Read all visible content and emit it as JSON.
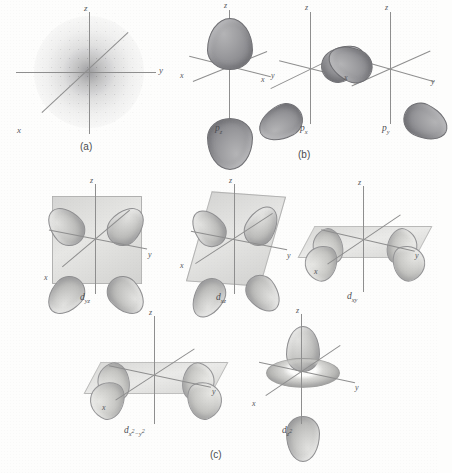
{
  "figure": {
    "panels": [
      {
        "id": "a",
        "label": "(a)",
        "caption": "s orbital electron density cloud"
      },
      {
        "id": "b",
        "label": "(b)",
        "caption": "p orbitals"
      },
      {
        "id": "c",
        "label": "(c)",
        "caption": "d orbitals"
      }
    ]
  },
  "axes": {
    "x": "x",
    "y": "y",
    "z": "z"
  },
  "orbitals": {
    "s": {
      "name": "s",
      "panel": "a",
      "lobes": 0,
      "shape": "spherical stippled density cloud"
    },
    "pz": {
      "label_base": "p",
      "label_sub": "z",
      "panel": "b",
      "lobes": 2,
      "axis": "z"
    },
    "px": {
      "label_base": "p",
      "label_sub": "x",
      "panel": "b",
      "lobes": 2,
      "axis": "x"
    },
    "py": {
      "label_base": "p",
      "label_sub": "y",
      "panel": "b",
      "lobes": 2,
      "axis": "y"
    },
    "dyz": {
      "label_base": "d",
      "label_sub": "yz",
      "panel": "c",
      "lobes": 4,
      "plane": "yz"
    },
    "dxz": {
      "label_base": "d",
      "label_sub": "xz",
      "panel": "c",
      "lobes": 4,
      "plane": "xz"
    },
    "dxy": {
      "label_base": "d",
      "label_sub": "xy",
      "panel": "c",
      "lobes": 4,
      "plane": "xy"
    },
    "dx2y2": {
      "label_base": "d",
      "label_sub_pre": "x",
      "label_sup1": "2",
      "label_sub_mid": "−y",
      "label_sup2": "2",
      "panel": "c",
      "lobes": 4,
      "plane": "xy"
    },
    "dz2": {
      "label_base": "d",
      "label_sub": "z",
      "label_sup": "2",
      "panel": "c",
      "lobes": 2,
      "torus": true,
      "axis": "z"
    }
  },
  "colors": {
    "background": "#fdfdfc",
    "axis_line": "#8e8e8e",
    "label_text": "#55565a",
    "p_lobe_fill": "#9e9ea1",
    "d_lobe_fill": "#cfcfcd",
    "plane_fill": "#b0b0ae"
  }
}
